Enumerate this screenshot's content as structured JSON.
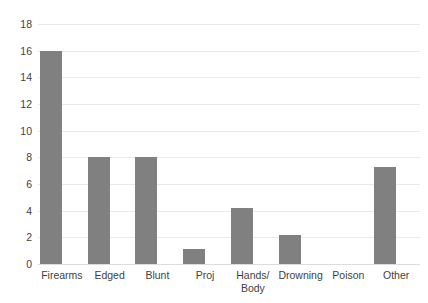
{
  "chart_data": {
    "type": "bar",
    "title": "",
    "subtitle": "",
    "xlabel": "",
    "ylabel": "",
    "categories": [
      "Firearms",
      "Edged",
      "Blunt",
      "Proj",
      "Hands/\nBody",
      "Drowning",
      "Poison",
      "Other"
    ],
    "values": [
      16,
      8,
      8,
      1.1,
      4.2,
      2.2,
      0,
      7.3
    ],
    "ylim": [
      0,
      18
    ],
    "ytick_labels": [
      "18",
      "16",
      "14",
      "12",
      "10",
      "8",
      "6",
      "4",
      "2",
      "0"
    ],
    "ytick_values": [
      18,
      16,
      14,
      12,
      10,
      8,
      6,
      4,
      2,
      0
    ],
    "grid": true,
    "legend": false,
    "series": [
      {
        "name": "",
        "values": [
          16,
          8,
          8,
          1.1,
          4.2,
          2.2,
          0,
          7.3
        ]
      }
    ]
  },
  "style": {
    "bar_color": "#808080",
    "gridline_color": "#e9e9e9",
    "text_color": "#3f3f3f",
    "background": "#ffffff"
  }
}
